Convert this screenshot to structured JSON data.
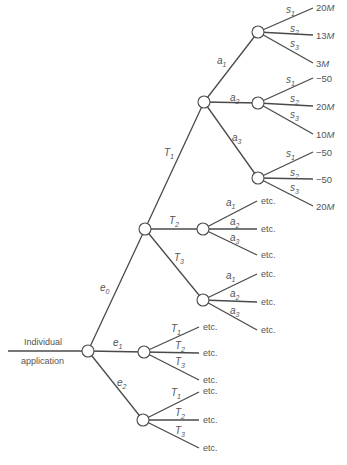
{
  "diagram": {
    "type": "decision-tree",
    "root_label_line1": "Individual",
    "root_label_line2": "application",
    "edges": {
      "e0": {
        "var": "e",
        "sub": "0"
      },
      "e1": {
        "var": "e",
        "sub": "1"
      },
      "e2": {
        "var": "e",
        "sub": "2"
      },
      "T1": {
        "var": "T",
        "sub": "1"
      },
      "T2": {
        "var": "T",
        "sub": "2"
      },
      "T3": {
        "var": "T",
        "sub": "3"
      },
      "a1": {
        "var": "a",
        "sub": "1"
      },
      "a2": {
        "var": "a",
        "sub": "2"
      },
      "a3": {
        "var": "a",
        "sub": "3"
      },
      "s1": {
        "var": "s",
        "sub": "1"
      },
      "s2": {
        "var": "s",
        "sub": "2"
      },
      "s3": {
        "var": "s",
        "sub": "3"
      }
    },
    "outcomes": {
      "a1": [
        "20M",
        "13M",
        "3M"
      ],
      "a2": [
        "−50",
        "20M",
        "10M"
      ],
      "a3": [
        "−50",
        "−50",
        "20M"
      ]
    },
    "outcome_parts": {
      "a1_s1_num": "20",
      "a1_s1_unit": "M",
      "a1_s2_num": "13",
      "a1_s2_unit": "M",
      "a1_s3_num": "3",
      "a1_s3_unit": "M",
      "a2_s1": "−50",
      "a2_s2_num": "20",
      "a2_s2_unit": "M",
      "a2_s3_num": "10",
      "a2_s3_unit": "M",
      "a3_s1": "−50",
      "a3_s2": "−50",
      "a3_s3_num": "20",
      "a3_s3_unit": "M"
    },
    "etc_label": "etc."
  }
}
